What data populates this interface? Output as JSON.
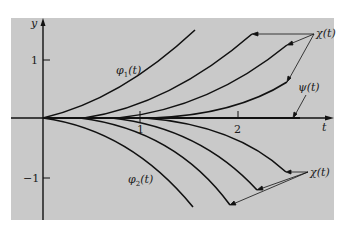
{
  "figure": {
    "type": "diagram",
    "background_color": "#c9c9c9",
    "ink_color": "#111111",
    "axes": {
      "x_label": "t",
      "y_label": "y",
      "x_ticks": [
        {
          "value": 1,
          "label": "1"
        },
        {
          "value": 2,
          "label": "2"
        }
      ],
      "y_ticks": [
        {
          "value": 1,
          "label": "1"
        },
        {
          "value": -1,
          "label": "−1"
        }
      ]
    },
    "labels": {
      "phi1": "φ",
      "phi1_sub": "1",
      "phi1_arg": "(t)",
      "phi2": "φ",
      "phi2_sub": "2",
      "phi2_arg": "(t)",
      "chi_upper": "χ(t)",
      "chi_lower": "χ(t)",
      "psi": "ψ(t)"
    },
    "curves": {
      "upper": [
        {
          "name": "phi1",
          "start_t": 0.0
        },
        {
          "name": "chi-1",
          "start_t": 0.45
        },
        {
          "name": "chi-2",
          "start_t": 0.8
        },
        {
          "name": "chi-3",
          "start_t": 1.15
        }
      ],
      "lower": [
        {
          "name": "phi2",
          "start_t": 0.0
        },
        {
          "name": "chi-4",
          "start_t": 0.45
        },
        {
          "name": "chi-5",
          "start_t": 0.8
        },
        {
          "name": "chi-6",
          "start_t": 1.15
        }
      ],
      "axis_solution": {
        "name": "psi",
        "description": "ψ(t) ≡ 0 along the t-axis"
      }
    }
  }
}
